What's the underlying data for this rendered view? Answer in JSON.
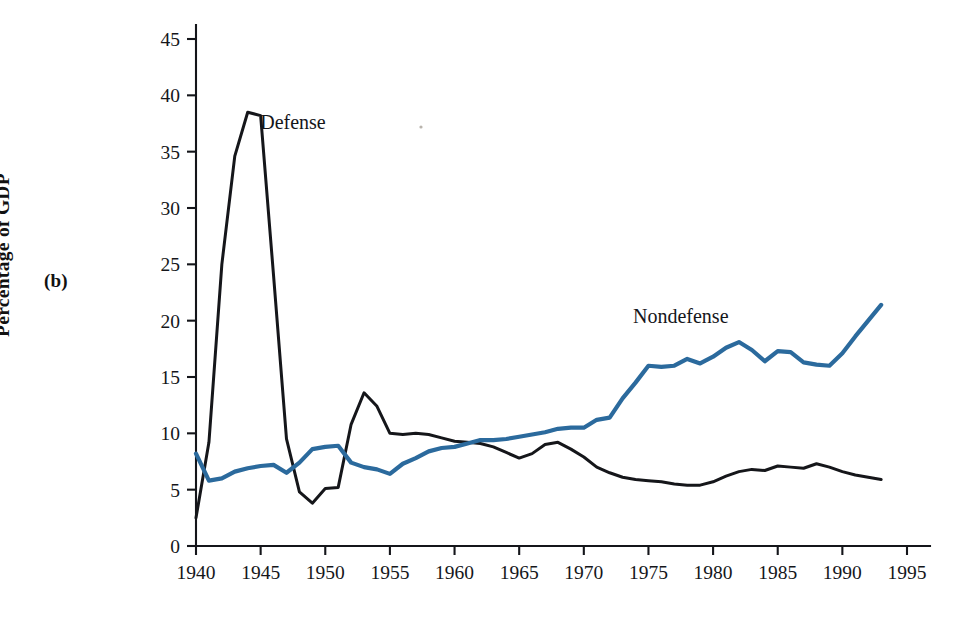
{
  "figure": {
    "panel_label": "(b)",
    "y_axis_title": "Percentage of GDP"
  },
  "chart_data": {
    "type": "line",
    "title": "",
    "xlabel": "",
    "ylabel": "Percentage of GDP",
    "xlim": [
      1940,
      1995
    ],
    "ylim": [
      0,
      45
    ],
    "xticks": [
      1940,
      1945,
      1950,
      1955,
      1960,
      1965,
      1970,
      1975,
      1980,
      1985,
      1990,
      1995
    ],
    "xtick_labels": [
      "1940",
      "1945",
      "1950",
      "1955",
      "1960",
      "1965",
      "1970",
      "1975",
      "1980",
      "1985",
      "1990",
      "1995"
    ],
    "yticks": [
      0,
      5,
      10,
      15,
      20,
      25,
      30,
      35,
      40,
      45
    ],
    "ytick_labels": [
      "0",
      "5",
      "10",
      "15",
      "20",
      "25",
      "30",
      "35",
      "40",
      "45"
    ],
    "grid": false,
    "legend_position": "inline-annotation",
    "x": [
      1940,
      1941,
      1942,
      1943,
      1944,
      1945,
      1946,
      1947,
      1948,
      1949,
      1950,
      1951,
      1952,
      1953,
      1954,
      1955,
      1956,
      1957,
      1958,
      1959,
      1960,
      1961,
      1962,
      1963,
      1964,
      1965,
      1966,
      1967,
      1968,
      1969,
      1970,
      1971,
      1972,
      1973,
      1974,
      1975,
      1976,
      1977,
      1978,
      1979,
      1980,
      1981,
      1982,
      1983,
      1984,
      1985,
      1986,
      1987,
      1988,
      1989,
      1990,
      1991,
      1992,
      1993
    ],
    "series": [
      {
        "name": "Defense",
        "color": "#15161a",
        "label_x": 1947.5,
        "label_y": 37.0,
        "values": [
          2.5,
          9.2,
          25.0,
          34.6,
          38.5,
          38.2,
          24.0,
          9.5,
          4.8,
          3.8,
          5.1,
          5.2,
          10.8,
          13.6,
          12.4,
          10.0,
          9.9,
          10.0,
          9.9,
          9.6,
          9.3,
          9.2,
          9.1,
          8.8,
          8.3,
          7.8,
          8.2,
          9.0,
          9.2,
          8.6,
          7.9,
          7.0,
          6.5,
          6.1,
          5.9,
          5.8,
          5.7,
          5.5,
          5.4,
          5.4,
          5.7,
          6.2,
          6.6,
          6.8,
          6.7,
          7.1,
          7.0,
          6.9,
          7.3,
          7.0,
          6.6,
          6.3,
          6.1,
          5.9
        ]
      },
      {
        "name": "Nondefense",
        "color": "#2b6a9d",
        "label_x": 1977.5,
        "label_y": 19.8,
        "values": [
          8.2,
          5.8,
          6.0,
          6.6,
          6.9,
          7.1,
          7.2,
          6.5,
          7.4,
          8.6,
          8.8,
          8.9,
          7.4,
          7.0,
          6.8,
          6.4,
          7.3,
          7.8,
          8.4,
          8.7,
          8.8,
          9.1,
          9.4,
          9.4,
          9.5,
          9.7,
          9.9,
          10.1,
          10.4,
          10.5,
          10.5,
          11.2,
          11.4,
          13.1,
          14.5,
          16.0,
          15.9,
          16.0,
          16.6,
          16.2,
          16.8,
          17.6,
          18.1,
          17.4,
          16.4,
          17.3,
          17.2,
          16.3,
          16.1,
          16.0,
          17.1,
          18.6,
          20.0,
          21.4
        ]
      }
    ]
  }
}
